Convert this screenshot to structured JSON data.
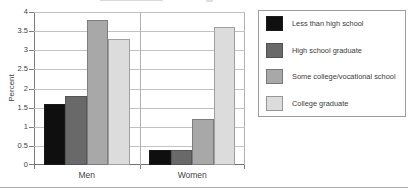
{
  "chart_data": {
    "type": "bar",
    "title": "",
    "xlabel": "",
    "ylabel": "Percent",
    "categories": [
      "Men",
      "Women"
    ],
    "series": [
      {
        "name": "Less than high school",
        "color": "#0f0f0f",
        "values": [
          1.6,
          0.4
        ]
      },
      {
        "name": "High school graduate",
        "color": "#696969",
        "values": [
          1.8,
          0.4
        ]
      },
      {
        "name": "Some college/vocational school",
        "color": "#a8a8a8",
        "values": [
          3.8,
          1.2
        ]
      },
      {
        "name": "College graduate",
        "color": "#dcdcdc",
        "values": [
          3.3,
          3.6
        ]
      }
    ],
    "ylim": [
      0,
      4
    ],
    "yticks": [
      0,
      0.5,
      1,
      1.5,
      2,
      2.5,
      3,
      3.5,
      4
    ],
    "ytick_labels": [
      "0",
      "0.5",
      "1",
      "1.5",
      "2",
      "2.5",
      "3",
      "3.5",
      "4"
    ],
    "grid": true,
    "legend_position": "right"
  },
  "colors": {
    "gridline": "#c2c2c2",
    "frame": "#b2b2b2",
    "axis": "#7e7e7e",
    "text": "#3f3f3f",
    "legend_border": "#9c9c9c",
    "background": "#ffffff"
  }
}
